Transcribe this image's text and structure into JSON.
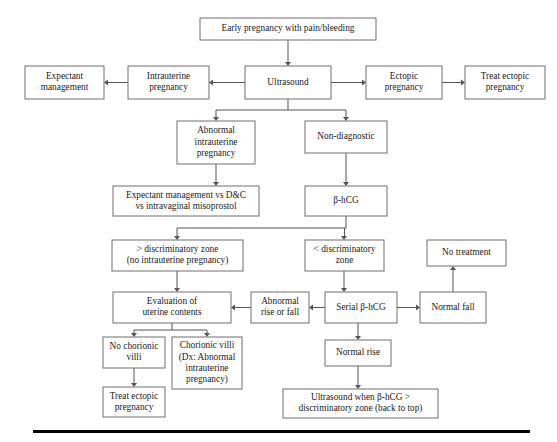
{
  "diagram": {
    "type": "flowchart",
    "colors": {
      "box_border": "#6e6e6e",
      "box_fill": "#ffffff",
      "connector": "#555555",
      "text": "#1a1a1a",
      "rule": "#000000"
    },
    "nodes": [
      {
        "id": "early-pregnancy",
        "lines": [
          "Early pregnancy with pain/bleeding"
        ],
        "x": 200,
        "y": 18,
        "w": 176,
        "h": 22
      },
      {
        "id": "ultrasound",
        "lines": [
          "Ultrasound"
        ],
        "x": 245,
        "y": 66,
        "w": 86,
        "h": 33
      },
      {
        "id": "intrauterine-pregnancy",
        "lines": [
          "Intrauterine",
          "pregnancy"
        ],
        "x": 128,
        "y": 66,
        "w": 81,
        "h": 33
      },
      {
        "id": "expectant-management",
        "lines": [
          "Expectant",
          "management"
        ],
        "x": 25,
        "y": 66,
        "w": 79,
        "h": 33
      },
      {
        "id": "ectopic-pregnancy",
        "lines": [
          "Ectopic",
          "pregnancy"
        ],
        "x": 366,
        "y": 66,
        "w": 76,
        "h": 33
      },
      {
        "id": "treat-ectopic-pregnancy-top",
        "lines": [
          "Treat ectopic",
          "pregnancy"
        ],
        "x": 465,
        "y": 66,
        "w": 80,
        "h": 33
      },
      {
        "id": "abnormal-intrauterine-pregnancy",
        "lines": [
          "Abnormal",
          "intrauterine",
          "pregnancy"
        ],
        "x": 177,
        "y": 121,
        "w": 78,
        "h": 43
      },
      {
        "id": "non-diagnostic",
        "lines": [
          "Non-diagnostic"
        ],
        "x": 305,
        "y": 121,
        "w": 82,
        "h": 32
      },
      {
        "id": "expectant-vs-dc",
        "lines": [
          "Expectant management vs D&C",
          "vs intravaginal misoprostol"
        ],
        "x": 113,
        "y": 186,
        "w": 146,
        "h": 30
      },
      {
        "id": "beta-hcg",
        "lines": [
          "β-hCG"
        ],
        "x": 305,
        "y": 186,
        "w": 82,
        "h": 30
      },
      {
        "id": "greater-discriminatory-zone",
        "lines": [
          "> discriminatory zone",
          "(no intrauterine pregnancy)"
        ],
        "x": 112,
        "y": 240,
        "w": 131,
        "h": 31
      },
      {
        "id": "less-discriminatory-zone",
        "lines": [
          "< discriminatory",
          "zone"
        ],
        "x": 305,
        "y": 240,
        "w": 79,
        "h": 31
      },
      {
        "id": "no-treatment",
        "lines": [
          "No treatment"
        ],
        "x": 427,
        "y": 240,
        "w": 79,
        "h": 26
      },
      {
        "id": "evaluation-uterine-contents",
        "lines": [
          "Evaluation of",
          "uterine contents"
        ],
        "x": 113,
        "y": 292,
        "w": 118,
        "h": 31
      },
      {
        "id": "abnormal-rise-or-fall",
        "lines": [
          "Abnormal",
          "rise or fall"
        ],
        "x": 251,
        "y": 292,
        "w": 58,
        "h": 31
      },
      {
        "id": "serial-beta-hcg",
        "lines": [
          "Serial β-hCG"
        ],
        "x": 325,
        "y": 292,
        "w": 72,
        "h": 31
      },
      {
        "id": "normal-fall",
        "lines": [
          "Normal fall"
        ],
        "x": 420,
        "y": 292,
        "w": 66,
        "h": 31
      },
      {
        "id": "no-chorionic-villi",
        "lines": [
          "No chorionic",
          "villi"
        ],
        "x": 103,
        "y": 337,
        "w": 62,
        "h": 31
      },
      {
        "id": "chorionic-villi",
        "lines": [
          "Chorionic villi",
          "(Dx: Abnormal",
          "intrauterine",
          "pregnancy)"
        ],
        "x": 172,
        "y": 337,
        "w": 70,
        "h": 52
      },
      {
        "id": "normal-rise",
        "lines": [
          "Normal rise"
        ],
        "x": 325,
        "y": 340,
        "w": 66,
        "h": 26
      },
      {
        "id": "treat-ectopic-pregnancy-bottom",
        "lines": [
          "Treat ectopic",
          "pregnancy"
        ],
        "x": 103,
        "y": 387,
        "w": 62,
        "h": 30
      },
      {
        "id": "ultrasound-when-beta-hcg",
        "lines": [
          "Ultrasound when β-hCG >",
          "discriminatory zone (back to top)"
        ],
        "x": 283,
        "y": 389,
        "w": 155,
        "h": 29
      }
    ],
    "connectors": [
      {
        "id": "early-to-ultrasound",
        "d": "M 288 40 L 288 62",
        "arrow": "down",
        "ax": 288,
        "ay": 66
      },
      {
        "id": "ultrasound-to-intrauterine",
        "d": "M 245 82.5 L 213 82.5",
        "arrow": "left",
        "ax": 209,
        "ay": 82.5
      },
      {
        "id": "intrauterine-to-expectant",
        "d": "M 128 82.5 L 108 82.5",
        "arrow": "left",
        "ax": 104,
        "ay": 82.5
      },
      {
        "id": "ultrasound-to-ectopic",
        "d": "M 331 82.5 L 362 82.5",
        "arrow": "right",
        "ax": 366,
        "ay": 82.5
      },
      {
        "id": "ectopic-to-treat",
        "d": "M 442 82.5 L 461 82.5",
        "arrow": "right",
        "ax": 465,
        "ay": 82.5
      },
      {
        "id": "ultrasound-split",
        "d": "M 288 99 L 288 110 M 216 110 L 346 110 M 216 110 L 216 117 M 346 110 L 346 117",
        "arrow": "none"
      },
      {
        "id": "to-abnormal-iup",
        "d": "",
        "arrow": "down",
        "ax": 216,
        "ay": 121
      },
      {
        "id": "to-non-diagnostic",
        "d": "",
        "arrow": "down",
        "ax": 346,
        "ay": 121
      },
      {
        "id": "abnormal-iup-to-expectant-vs",
        "d": "M 216 164 L 216 182",
        "arrow": "down",
        "ax": 216,
        "ay": 186
      },
      {
        "id": "non-diagnostic-to-bhcg",
        "d": "M 346 153 L 346 182",
        "arrow": "down",
        "ax": 346,
        "ay": 186
      },
      {
        "id": "bhcg-split",
        "d": "M 346 216 L 346 228 M 177 228 L 346 228 M 177 228 L 177 236 M 344.5 228 L 344.5 236",
        "arrow": "none"
      },
      {
        "id": "to-greater-zone",
        "d": "",
        "arrow": "down",
        "ax": 177,
        "ay": 240
      },
      {
        "id": "to-less-zone",
        "d": "",
        "arrow": "down",
        "ax": 344,
        "ay": 240
      },
      {
        "id": "greater-zone-to-evaluation",
        "d": "M 177 271 L 177 288",
        "arrow": "down",
        "ax": 177,
        "ay": 292
      },
      {
        "id": "less-zone-to-serial",
        "d": "M 344 271 L 344 288",
        "arrow": "down",
        "ax": 344,
        "ay": 292
      },
      {
        "id": "serial-to-abnormal-rise",
        "d": "M 325 307.5 L 313 307.5",
        "arrow": "left",
        "ax": 309,
        "ay": 307.5
      },
      {
        "id": "abnormal-rise-to-evaluation",
        "d": "M 251 307.5 L 235 307.5",
        "arrow": "left",
        "ax": 231,
        "ay": 307.5
      },
      {
        "id": "serial-to-normal-fall",
        "d": "M 397 307.5 L 416 307.5",
        "arrow": "right",
        "ax": 420,
        "ay": 307.5
      },
      {
        "id": "normal-fall-to-no-treatment",
        "d": "M 453 292 L 453 270",
        "arrow": "up",
        "ax": 453,
        "ay": 266
      },
      {
        "id": "serial-to-normal-rise",
        "d": "M 358 323 L 358 336",
        "arrow": "down",
        "ax": 358,
        "ay": 340
      },
      {
        "id": "evaluation-split",
        "d": "M 172 323 L 172 330 M 134 330 L 207 330 M 134 330 L 134 333 M 207 330 L 207 333",
        "arrow": "none"
      },
      {
        "id": "to-no-chorionic",
        "d": "",
        "arrow": "down",
        "ax": 134,
        "ay": 337
      },
      {
        "id": "to-chorionic",
        "d": "",
        "arrow": "down",
        "ax": 207,
        "ay": 337
      },
      {
        "id": "no-chorionic-to-treat",
        "d": "M 134 368 L 134 383",
        "arrow": "down",
        "ax": 134,
        "ay": 387
      },
      {
        "id": "normal-rise-to-ultrasound-when",
        "d": "M 358 366 L 358 385",
        "arrow": "down",
        "ax": 358,
        "ay": 389
      }
    ],
    "bottom_rule": {
      "x": 33,
      "y": 430,
      "w": 497,
      "h": 3
    }
  }
}
